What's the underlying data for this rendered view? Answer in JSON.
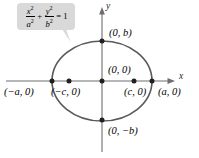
{
  "figure": {
    "type": "ellipse-diagram",
    "background_color": "#ffffff",
    "curve_color": "#58595b",
    "axis_color": "#6d6e71",
    "callout_color": "#d9d9da",
    "text_color": "#000000"
  },
  "equation": {
    "x_num": "x",
    "x_num_exp": "2",
    "x_den": "a",
    "x_den_exp": "2",
    "plus": "+",
    "y_num": "y",
    "y_num_exp": "2",
    "y_den": "b",
    "y_den_exp": "2",
    "equals": "= 1",
    "plain": "x²/a² + y²/b² = 1"
  },
  "axes": {
    "x_label": "x",
    "y_label": "y",
    "origin_px": {
      "x": 102,
      "y": 81
    }
  },
  "labels": {
    "top_vertex": "(0, b)",
    "bottom_vertex": "(0, −b)",
    "left_vertex": "(−a, 0)",
    "right_vertex": "(a, 0)",
    "left_focus": "(−c, 0)",
    "right_focus": "(c, 0)",
    "center": "(0, 0)"
  },
  "points": [
    {
      "name": "left-vertex",
      "label": "(−a, 0)",
      "px": {
        "x": 52,
        "y": 81
      },
      "dot": true
    },
    {
      "name": "left-focus",
      "label": "(−c, 0)",
      "px": {
        "x": 69,
        "y": 81
      },
      "dot": true
    },
    {
      "name": "center",
      "label": "(0, 0)",
      "px": {
        "x": 102,
        "y": 81
      },
      "dot": true
    },
    {
      "name": "right-focus",
      "label": "(c, 0)",
      "px": {
        "x": 134,
        "y": 81
      },
      "dot": true
    },
    {
      "name": "right-vertex",
      "label": "(a, 0)",
      "px": {
        "x": 152,
        "y": 81
      },
      "dot": true
    },
    {
      "name": "top-vertex",
      "label": "(0, b)",
      "px": {
        "x": 102,
        "y": 41
      },
      "dot": true
    },
    {
      "name": "bottom-vertex",
      "label": "(0, −b)",
      "px": {
        "x": 102,
        "y": 120
      },
      "dot": true
    }
  ],
  "ellipse": {
    "center_px": {
      "x": 102,
      "y": 81
    },
    "semi_major_px": 50,
    "semi_minor_px": 40
  }
}
